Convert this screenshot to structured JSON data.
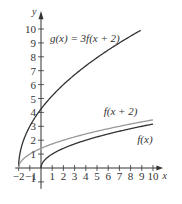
{
  "chart_data": {
    "type": "line",
    "title": "",
    "xlabel": "x",
    "ylabel": "y",
    "xlim": [
      -2,
      10.5
    ],
    "ylim": [
      -1,
      10.8
    ],
    "grid": false,
    "x_ticks": [
      "-2",
      "-1",
      "1",
      "2",
      "3",
      "4",
      "5",
      "6",
      "7",
      "8",
      "9",
      "10"
    ],
    "y_ticks": [
      "-1",
      "1",
      "2",
      "3",
      "4",
      "5",
      "6",
      "7",
      "8",
      "9",
      "10"
    ],
    "series": [
      {
        "name": "g(x) = 3f(x + 2)",
        "label": "g(x) = 3f(x + 2)",
        "color": "#333333",
        "formula": "3*sqrt(x+2)",
        "x": [
          -2,
          -1,
          0,
          1,
          2,
          3,
          4,
          5,
          6,
          7,
          8,
          8.9
        ],
        "y": [
          0,
          3,
          4.24,
          5.2,
          6,
          6.71,
          7.35,
          7.94,
          8.49,
          9,
          9.49,
          9.92
        ]
      },
      {
        "name": "f(x + 2)",
        "label": "f(x + 2)",
        "color": "#999999",
        "formula": "sqrt(x+2)",
        "x": [
          -2,
          -1,
          0,
          1,
          2,
          3,
          4,
          5,
          6,
          7,
          8,
          9,
          10
        ],
        "y": [
          0,
          1,
          1.41,
          1.73,
          2,
          2.24,
          2.45,
          2.65,
          2.83,
          3,
          3.16,
          3.32,
          3.46
        ]
      },
      {
        "name": "f(x)",
        "label": "f(x)",
        "color": "#333333",
        "formula": "sqrt(x)",
        "x": [
          0,
          1,
          2,
          3,
          4,
          5,
          6,
          7,
          8,
          9,
          10
        ],
        "y": [
          0,
          1,
          1.41,
          1.73,
          2,
          2.24,
          2.45,
          2.65,
          2.83,
          3,
          3.16
        ]
      }
    ],
    "annotations": [
      {
        "text": "g(x) = 3f(x + 2)",
        "at": [
          0.8,
          9.1
        ]
      },
      {
        "text": "f(x + 2)",
        "at": [
          5.6,
          3.8
        ]
      },
      {
        "text": "f(x)",
        "at": [
          8.6,
          1.8
        ]
      }
    ]
  }
}
